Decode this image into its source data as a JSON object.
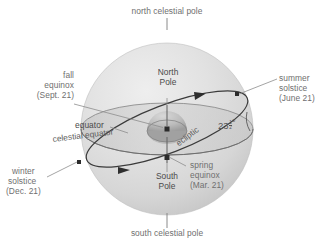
{
  "diagram": {
    "colors": {
      "sphere_light": "#e3e3e3",
      "sphere_mid": "#d2d2d2",
      "sphere_dark": "#c2c2c2",
      "line": "#3a3a3a",
      "text": "#6f6f6f",
      "text_dark": "#4a4a4a",
      "background": "#ffffff"
    },
    "labels": {
      "north_celestial_pole": "north celestial pole",
      "south_celestial_pole": "south celestial pole",
      "north_pole": "North\nPole",
      "north_pole_line1": "North",
      "north_pole_line2": "Pole",
      "south_pole_line1": "South",
      "south_pole_line2": "Pole",
      "equator": "equator",
      "celestial_equator": "celestial equator",
      "ecliptic": "ecliptic",
      "fall_equinox_line1": "fall",
      "fall_equinox_line2": "equinox",
      "fall_equinox_line3": "(Sept. 21)",
      "summer_solstice_line1": "summer",
      "summer_solstice_line2": "solstice",
      "summer_solstice_line3": "(June 21)",
      "winter_solstice_line1": "winter",
      "winter_solstice_line2": "solstice",
      "winter_solstice_line3": "(Dec. 21)",
      "spring_equinox_line1": "spring",
      "spring_equinox_line2": "equinox",
      "spring_equinox_line3": "(Mar. 21)",
      "tilt_angle_whole": "23",
      "tilt_angle_numerator": "1",
      "tilt_angle_denominator": "2",
      "tilt_angle_degree": "o"
    }
  }
}
